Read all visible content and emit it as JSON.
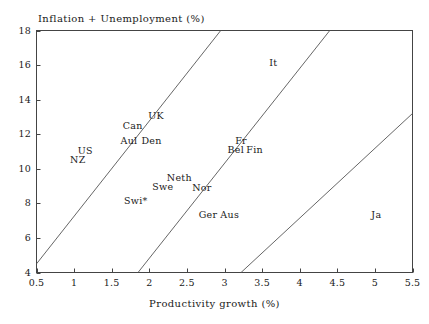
{
  "chart_data": {
    "type": "scatter",
    "title": "",
    "xlabel": "Productivity growth (%)",
    "ylabel": "Inflation + Unemployment (%)",
    "xlim": [
      0.5,
      5.5
    ],
    "ylim": [
      4,
      18
    ],
    "xticks": [
      "0.5",
      "1",
      "1.5",
      "2",
      "2.5",
      "3",
      "3.5",
      "4",
      "4.5",
      "5",
      "5.5"
    ],
    "xtick_values": [
      0.5,
      1,
      1.5,
      2,
      2.5,
      3,
      3.5,
      4,
      4.5,
      5,
      5.5
    ],
    "yticks": [
      "18",
      "16",
      "14",
      "12",
      "10",
      "8",
      "6",
      "4"
    ],
    "ytick_values": [
      18,
      16,
      14,
      12,
      10,
      8,
      6,
      4
    ],
    "grid": false,
    "legend": "none",
    "frame": true,
    "point_style": "text-label-only",
    "labels": [
      {
        "name": "NZ",
        "x": 1.05,
        "y": 10.55
      },
      {
        "name": "US",
        "x": 1.15,
        "y": 11.1
      },
      {
        "name": "Aul",
        "x": 1.73,
        "y": 11.65
      },
      {
        "name": "Can",
        "x": 1.78,
        "y": 12.55
      },
      {
        "name": "Den",
        "x": 2.03,
        "y": 11.65
      },
      {
        "name": "UK",
        "x": 2.09,
        "y": 13.1
      },
      {
        "name": "Swi*",
        "x": 1.82,
        "y": 8.2
      },
      {
        "name": "Swe",
        "x": 2.18,
        "y": 9.0
      },
      {
        "name": "Neth",
        "x": 2.4,
        "y": 9.5
      },
      {
        "name": "Nor",
        "x": 2.7,
        "y": 8.95
      },
      {
        "name": "Ger",
        "x": 2.78,
        "y": 7.4
      },
      {
        "name": "Aus",
        "x": 3.07,
        "y": 7.4
      },
      {
        "name": "Fr",
        "x": 3.22,
        "y": 11.65
      },
      {
        "name": "Bel",
        "x": 3.15,
        "y": 11.15
      },
      {
        "name": "Fin",
        "x": 3.4,
        "y": 11.15
      },
      {
        "name": "It",
        "x": 3.65,
        "y": 16.15
      },
      {
        "name": "Ja",
        "x": 5.02,
        "y": 7.4
      }
    ],
    "isolines": [
      {
        "id": "isoline-1",
        "x0": 0.5,
        "y0": 4.5,
        "x1": 2.95,
        "y1": 18.0
      },
      {
        "id": "isoline-2",
        "x0": 1.85,
        "y0": 4.0,
        "x1": 4.4,
        "y1": 18.0
      },
      {
        "id": "isoline-3",
        "x0": 3.22,
        "y0": 4.0,
        "x1": 5.5,
        "y1": 13.2
      }
    ]
  }
}
